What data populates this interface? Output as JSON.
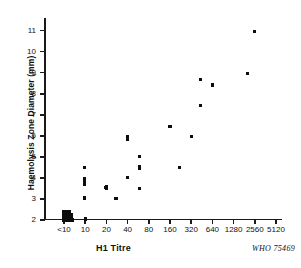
{
  "chart_data": {
    "type": "scatter",
    "title": "",
    "xlabel": "H1 Titre",
    "ylabel": "Haemolysis Zone Diameter (mm)",
    "credit": "WHO 75469",
    "grid": false,
    "legend": null,
    "x_tick_labels": [
      "<10",
      "10",
      "20",
      "40",
      "80",
      "160",
      "320",
      "640",
      "1280",
      "2560",
      "5120"
    ],
    "y_tick_labels": [
      "2",
      "3",
      "4",
      "5",
      "6",
      "7",
      "8",
      "9",
      "10",
      "11"
    ],
    "ylim": [
      2,
      11.6
    ],
    "x_scale": "log2-categorical",
    "points": [
      {
        "titre": "<10",
        "x_index": 0.0,
        "y": 2.0
      },
      {
        "titre": "<10",
        "x_index": 0.1,
        "y": 2.0
      },
      {
        "titre": "<10",
        "x_index": 0.2,
        "y": 2.0
      },
      {
        "titre": "<10",
        "x_index": 0.3,
        "y": 2.0
      },
      {
        "titre": "<10",
        "x_index": 0.42,
        "y": 2.0
      },
      {
        "titre": "<10",
        "x_index": 0.0,
        "y": 2.12
      },
      {
        "titre": "<10",
        "x_index": 0.12,
        "y": 2.12
      },
      {
        "titre": "<10",
        "x_index": 0.24,
        "y": 2.12
      },
      {
        "titre": "<10",
        "x_index": 0.36,
        "y": 2.12
      },
      {
        "titre": "<10",
        "x_index": 0.0,
        "y": 2.26
      },
      {
        "titre": "<10",
        "x_index": 0.12,
        "y": 2.26
      },
      {
        "titre": "<10",
        "x_index": 0.24,
        "y": 2.26
      },
      {
        "titre": "<10",
        "x_index": 0.36,
        "y": 2.26
      },
      {
        "titre": "<10",
        "x_index": 0.0,
        "y": 2.4
      },
      {
        "titre": "<10",
        "x_index": 0.13,
        "y": 2.4
      },
      {
        "titre": "<10",
        "x_index": 0.26,
        "y": 2.4
      },
      {
        "titre": "10",
        "x_index": 1.0,
        "y": 2.05
      },
      {
        "titre": "10",
        "x_index": 0.98,
        "y": 3.05
      },
      {
        "titre": "10",
        "x_index": 0.98,
        "y": 3.7
      },
      {
        "titre": "10",
        "x_index": 0.98,
        "y": 3.8
      },
      {
        "titre": "10",
        "x_index": 0.98,
        "y": 3.95
      },
      {
        "titre": "10",
        "x_index": 0.98,
        "y": 4.5
      },
      {
        "titre": "20",
        "x_index": 1.95,
        "y": 3.55
      },
      {
        "titre": "20",
        "x_index": 2.0,
        "y": 3.6
      },
      {
        "titre": "20",
        "x_index": 2.0,
        "y": 3.5
      },
      {
        "titre": "30",
        "x_index": 2.45,
        "y": 3.02
      },
      {
        "titre": "40",
        "x_index": 3.0,
        "y": 4.02
      },
      {
        "titre": "40",
        "x_index": 3.0,
        "y": 5.82
      },
      {
        "titre": "40",
        "x_index": 3.0,
        "y": 5.98
      },
      {
        "titre": "60",
        "x_index": 3.55,
        "y": 3.5
      },
      {
        "titre": "60",
        "x_index": 3.55,
        "y": 4.45
      },
      {
        "titre": "60",
        "x_index": 3.58,
        "y": 4.52
      },
      {
        "titre": "60",
        "x_index": 3.55,
        "y": 5.02
      },
      {
        "titre": "160",
        "x_index": 5.0,
        "y": 6.45
      },
      {
        "titre": "220",
        "x_index": 5.45,
        "y": 4.48
      },
      {
        "titre": "320",
        "x_index": 6.0,
        "y": 5.98
      },
      {
        "titre": "480",
        "x_index": 6.45,
        "y": 7.45
      },
      {
        "titre": "480",
        "x_index": 6.45,
        "y": 8.68
      },
      {
        "titre": "640",
        "x_index": 7.0,
        "y": 8.42
      },
      {
        "titre": "1900",
        "x_index": 8.65,
        "y": 8.98
      },
      {
        "titre": "2560",
        "x_index": 9.0,
        "y": 10.95
      }
    ]
  }
}
